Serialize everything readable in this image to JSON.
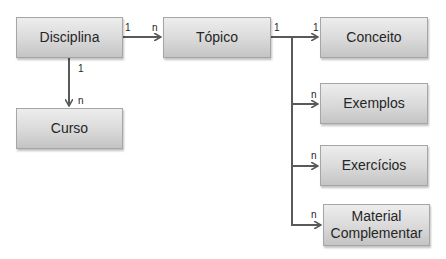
{
  "diagram": {
    "nodes": [
      {
        "id": "disciplina",
        "label": "Disciplina"
      },
      {
        "id": "curso",
        "label": "Curso"
      },
      {
        "id": "topico",
        "label": "Tópico"
      },
      {
        "id": "conceito",
        "label": "Conceito"
      },
      {
        "id": "exemplos",
        "label": "Exemplos"
      },
      {
        "id": "exercicios",
        "label": "Exercícios"
      },
      {
        "id": "material",
        "label": "Material Complementar",
        "lines": [
          "Material",
          "Complementar"
        ]
      }
    ],
    "edges": [
      {
        "from": "disciplina",
        "to": "topico",
        "from_card": "1",
        "to_card": "n"
      },
      {
        "from": "disciplina",
        "to": "curso",
        "from_card": "1",
        "to_card": "n"
      },
      {
        "from": "topico",
        "to": "conceito",
        "from_card": "1",
        "to_card": "1"
      },
      {
        "from": "topico",
        "to": "exemplos",
        "from_card": "1",
        "to_card": "n"
      },
      {
        "from": "topico",
        "to": "exercicios",
        "from_card": "1",
        "to_card": "n"
      },
      {
        "from": "topico",
        "to": "material",
        "from_card": "1",
        "to_card": "n"
      }
    ],
    "colors": {
      "box_fill_top": "#ededed",
      "box_fill_bottom": "#c4c4c4",
      "box_border": "#a6a6a6",
      "connector": "#595959",
      "text": "#262626"
    }
  }
}
